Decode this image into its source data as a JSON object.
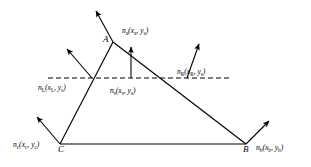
{
  "figure": {
    "type": "geometric-diagram",
    "background_color": "#ffffff",
    "line_color": "#000000",
    "vertices": [
      {
        "name": "A",
        "label": "A",
        "x": 113,
        "y": 42
      },
      {
        "name": "C",
        "label": "C",
        "x": 60,
        "y": 144
      },
      {
        "name": "B",
        "label": "B",
        "x": 246,
        "y": 144
      }
    ],
    "edges": [
      {
        "name": "edge-AC",
        "from": "A",
        "to": "C"
      },
      {
        "name": "edge-AB",
        "from": "A",
        "to": "B"
      },
      {
        "name": "edge-CB",
        "from": "C",
        "to": "B"
      }
    ],
    "dashed_line": {
      "name": "scan-line",
      "y": 78,
      "x_start": 48,
      "x_end": 232,
      "dash_pattern": "5,3"
    },
    "intersections": [
      {
        "name": "left-intersection",
        "x": 92,
        "y": 78
      },
      {
        "name": "right-intersection",
        "x": 187,
        "y": 78
      }
    ],
    "normals": [
      {
        "name": "normal-a",
        "x1": 113,
        "y1": 42,
        "x2": 96,
        "y2": 11
      },
      {
        "name": "normal-c",
        "x1": 60,
        "y1": 144,
        "x2": 37,
        "y2": 117
      },
      {
        "name": "normal-b",
        "x1": 246,
        "y1": 144,
        "x2": 269,
        "y2": 121
      },
      {
        "name": "normal-left",
        "x1": 92,
        "y1": 78,
        "x2": 67,
        "y2": 49
      },
      {
        "name": "normal-s",
        "x1": 131,
        "y1": 78,
        "x2": 131,
        "y2": 47
      },
      {
        "name": "normal-right",
        "x1": 187,
        "y1": 78,
        "x2": 199,
        "y2": 44
      }
    ],
    "labels": {
      "n_a": {
        "symbol": "n",
        "sub": "a",
        "args": "(x",
        "args_sub1": "a",
        "args_mid": ", y",
        "args_sub2": "a",
        "args_end": ")",
        "text": "na(xa, ya)"
      },
      "n_L": {
        "symbol": "n",
        "sub": "L",
        "text": "nL(xL, ys)"
      },
      "n_s": {
        "symbol": "n",
        "sub": "s",
        "text": "ns(xs, ys)"
      },
      "n_R": {
        "symbol": "n",
        "sub": "R",
        "text": "nR(xR, ys)"
      },
      "n_c": {
        "symbol": "n",
        "sub": "c",
        "text": "nc(xc, yc)"
      },
      "n_b": {
        "symbol": "n",
        "sub": "b",
        "text": "nb(xb, yb)"
      }
    },
    "label_parts": {
      "n_a": {
        "n": "n",
        "s1": "a",
        "p1": "(x",
        "s2": "a",
        "p2": ", y",
        "s3": "a",
        "p3": ")"
      },
      "n_L": {
        "n": "n",
        "s1": "L",
        "p1": "(x",
        "s2": "L",
        "p2": ", y",
        "s3": "s",
        "p3": ")"
      },
      "n_s": {
        "n": "n",
        "s1": "s",
        "p1": "(x",
        "s2": "s",
        "p2": ", y",
        "s3": "s",
        "p3": ")"
      },
      "n_R": {
        "n": "n",
        "s1": "R",
        "p1": "(x",
        "s2": "R",
        "p2": ", y",
        "s3": "s",
        "p3": ")"
      },
      "n_c": {
        "n": "n",
        "s1": "c",
        "p1": "(x",
        "s2": "c",
        "p2": ", y",
        "s3": "c",
        "p3": ")"
      },
      "n_b": {
        "n": "n",
        "s1": "b",
        "p1": "(x",
        "s2": "b",
        "p2": ", y",
        "s3": "b",
        "p3": ")"
      }
    },
    "vertex_labels": {
      "A": "A",
      "B": "B",
      "C": "C"
    }
  }
}
